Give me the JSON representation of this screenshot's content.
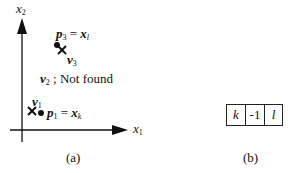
{
  "panel_a": {
    "caption": "(a)",
    "axis_x_label": "x",
    "axis_x_sub": "1",
    "axis_y_label": "x",
    "axis_y_sub": "2",
    "p3": {
      "lhs": "p",
      "lhs_sub": "3",
      "eq": " = ",
      "rhs": "x",
      "rhs_sub": "l"
    },
    "v3": {
      "label": "v",
      "sub": "3"
    },
    "v2_note": {
      "label": "v",
      "sub": "2",
      "text": " ; Not found"
    },
    "v1": {
      "label": "v",
      "sub": "1"
    },
    "p1": {
      "lhs": "p",
      "lhs_sub": "1",
      "eq": " = ",
      "rhs": "x",
      "rhs_sub": "k"
    }
  },
  "panel_b": {
    "caption": "(b)",
    "cells": [
      "k",
      "-1",
      "l"
    ]
  }
}
